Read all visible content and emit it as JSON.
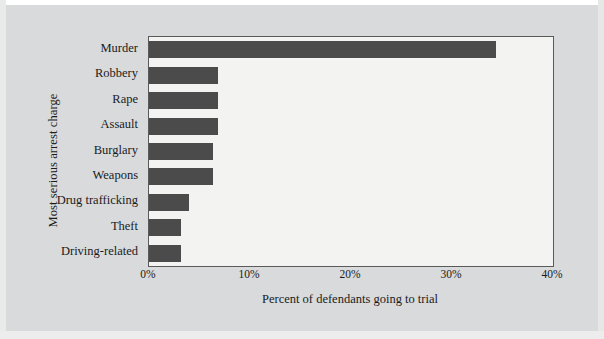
{
  "chart_data": {
    "type": "bar",
    "orientation": "horizontal",
    "title": "",
    "xlabel": "Percent of defendants going to trial",
    "ylabel": "Most serious arrest charge",
    "categories": [
      "Murder",
      "Robbery",
      "Rape",
      "Assault",
      "Burglary",
      "Weapons",
      "Drug trafficking",
      "Theft",
      "Driving-related"
    ],
    "values": [
      34.4,
      6.8,
      6.8,
      6.8,
      6.3,
      6.3,
      4.0,
      3.2,
      3.2
    ],
    "xlim": [
      0,
      40
    ],
    "xticks": [
      0,
      10,
      20,
      30,
      40
    ],
    "xtick_labels": [
      "0%",
      "10%",
      "20%",
      "30%",
      "40%"
    ],
    "grid": false,
    "legend": false,
    "bar_color": "#4b4b4b",
    "plot_background": "#f3f3f2",
    "figure_background": "#d8dadb",
    "axis_color": "#5a5a5a"
  }
}
